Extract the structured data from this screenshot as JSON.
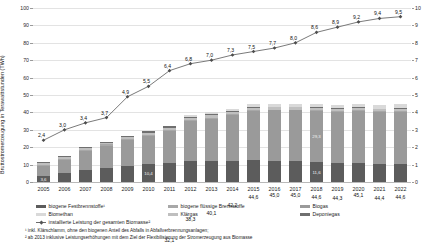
{
  "axes": {
    "left_title": "Bruttostromerzeugung in Terawattstunden (TWh)",
    "right_title": "Installierte Leistung in Gigawatt (GW)",
    "left_ticks": [
      "0",
      "10",
      "20",
      "30",
      "40",
      "50",
      "60",
      "70",
      "80",
      "90",
      "100"
    ],
    "right_ticks": [
      "0",
      "1",
      "2",
      "3",
      "4",
      "5",
      "6",
      "7",
      "8",
      "9",
      "10"
    ]
  },
  "legend": {
    "items": [
      {
        "label": "biogene Festbrennstoffe¹",
        "color": "#5c5c5c"
      },
      {
        "label": "biogene flüssige Brennstoffe",
        "color": "#a8a8a8"
      },
      {
        "label": "Biogas",
        "color": "#9a9a9a"
      },
      {
        "label": "Biomethan",
        "color": "#d9d9d9"
      },
      {
        "label": "Klärgas",
        "color": "#bfbfbf"
      },
      {
        "label": "Deponiegas",
        "color": "#6f6f6f"
      }
    ],
    "line_label": "installierte Leistung der gesamten Biomasse²"
  },
  "footnotes": {
    "one": "¹ inkl. Klärschlamm, ohne den biogenen Anteil des Abfalls in Abfallverbrennungsanlagen;",
    "two": "² ab 2013 inklusive Leistungserhöhungen mit dem Ziel der Flexibilisierung der Stromerzeugung aus Biomasse"
  },
  "chart_data": {
    "type": "bar",
    "title": "",
    "xlabel": "",
    "ylabel": "Bruttostromerzeugung in Terawattstunden (TWh)",
    "ylabel_right": "Installierte Leistung in Gigawatt (GW)",
    "ylim": [
      0,
      100
    ],
    "ylim_right": [
      0,
      10
    ],
    "grid": true,
    "legend_position": "bottom",
    "stacked": true,
    "categories": [
      "2005",
      "2006",
      "2007",
      "2008",
      "2009",
      "2010",
      "2011",
      "2012",
      "2013",
      "2014",
      "2015",
      "2016",
      "2017",
      "2018",
      "2019",
      "2020",
      "2021",
      "2022"
    ],
    "series": [
      {
        "name": "biogene Festbrennstoffe¹",
        "color": "#5c5c5c",
        "values": [
          3.6,
          5.0,
          6.8,
          8.0,
          9.4,
          10.4,
          11.0,
          11.9,
          12.0,
          12.1,
          12.4,
          12.3,
          12.1,
          11.6,
          11.2,
          11.1,
          10.6,
          10.4
        ]
      },
      {
        "name": "Biogas",
        "color": "#9a9a9a",
        "values": [
          5.6,
          7.6,
          10.8,
          12.8,
          14.6,
          16.0,
          18.3,
          23.0,
          24.5,
          26.6,
          28.6,
          29.0,
          29.2,
          29.3,
          29.2,
          29.8,
          29.7,
          30.1
        ]
      },
      {
        "name": "biogene flüssige Brennstoffe",
        "color": "#a8a8a8",
        "values": [
          0.5,
          0.6,
          0.7,
          0.8,
          0.9,
          0.9,
          0.8,
          0.6,
          0.5,
          0.4,
          0.4,
          0.3,
          0.3,
          0.3,
          0.3,
          0.3,
          0.3,
          0.3
        ]
      },
      {
        "name": "Klärgas",
        "color": "#bfbfbf",
        "values": [
          1.0,
          1.1,
          1.1,
          1.1,
          1.1,
          1.1,
          1.2,
          1.2,
          1.3,
          1.3,
          1.3,
          1.3,
          1.3,
          1.4,
          1.4,
          1.4,
          1.4,
          1.4
        ]
      },
      {
        "name": "Deponiegas",
        "color": "#6f6f6f",
        "values": [
          0.8,
          0.7,
          0.7,
          0.5,
          0.6,
          0.8,
          0.8,
          0.6,
          0.6,
          0.5,
          0.5,
          0.4,
          0.4,
          0.3,
          0.3,
          0.3,
          0.2,
          0.2
        ]
      },
      {
        "name": "Biomethan",
        "color": "#d9d9d9",
        "values": [
          0.0,
          0.0,
          0.0,
          0.0,
          0.0,
          0.0,
          0.0,
          1.0,
          1.2,
          1.3,
          1.4,
          1.7,
          1.7,
          1.7,
          1.9,
          2.2,
          2.2,
          2.2
        ]
      }
    ],
    "bar_totals": [
      "11,5",
      "15,0",
      "20,1",
      "23,2",
      "26,6",
      "29,2",
      "32,1",
      "38,3",
      "40,1",
      "42,2",
      "44,6",
      "45,0",
      "45,0",
      "44,6",
      "44,3",
      "45,1",
      "44,4",
      "44,6"
    ],
    "bar_totals_num": [
      11.5,
      15.0,
      20.1,
      23.2,
      26.6,
      29.2,
      32.1,
      38.3,
      40.1,
      42.2,
      44.6,
      45.0,
      45.0,
      44.6,
      44.3,
      45.1,
      44.4,
      44.6
    ],
    "line": {
      "name": "installierte Leistung der gesamten Biomasse²",
      "color": "#6b6b6b",
      "axis": "right",
      "values": [
        2.4,
        3.0,
        3.4,
        3.7,
        4.9,
        5.5,
        6.4,
        6.8,
        7.0,
        7.3,
        7.5,
        7.7,
        8.0,
        8.6,
        8.9,
        9.2,
        9.4,
        9.5
      ],
      "labels": [
        "2,4",
        "3,0",
        "3,4",
        "3,7",
        "4,9",
        "5,5",
        "6,4",
        "6,8",
        "7,0",
        "7,3",
        "7,5",
        "7,7",
        "8,0",
        "8,6",
        "8,9",
        "9,2",
        "9,4",
        "9,5"
      ]
    },
    "inner_labels": {
      "2005": "3,6",
      "2010": "10,4",
      "2018": "29,3",
      "2018b": "11,6"
    }
  }
}
